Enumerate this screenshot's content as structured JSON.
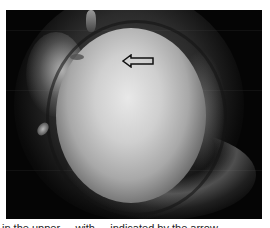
{
  "figure": {
    "arrow_icon": "arrow-left-outline",
    "background_color": "#050505"
  },
  "caption": {
    "text": "in the upper ... with ... indicated by the arrow ..."
  }
}
